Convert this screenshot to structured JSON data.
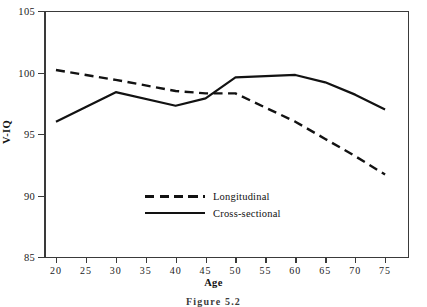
{
  "chart_data": {
    "type": "line",
    "title": "",
    "xlabel": "Age",
    "ylabel": "V-IQ",
    "xlim": [
      18,
      79
    ],
    "ylim": [
      85,
      105
    ],
    "xticks": [
      20,
      25,
      30,
      35,
      40,
      45,
      50,
      55,
      60,
      65,
      70,
      75
    ],
    "yticks": [
      85,
      90,
      95,
      100,
      105
    ],
    "grid": false,
    "legend_position": "inside-center-lower",
    "series": [
      {
        "name": "Longitudinal",
        "style": "dashed",
        "color": "#121212",
        "x": [
          20,
          30,
          40,
          45,
          50,
          60,
          65,
          70,
          75
        ],
        "values": [
          100.2,
          99.4,
          98.5,
          98.3,
          98.3,
          96.0,
          94.6,
          93.2,
          91.7
        ]
      },
      {
        "name": "Cross-sectional",
        "style": "solid",
        "color": "#121212",
        "x": [
          20,
          30,
          40,
          45,
          50,
          55,
          60,
          65,
          70,
          75
        ],
        "values": [
          96.0,
          98.4,
          97.3,
          97.9,
          99.6,
          99.7,
          99.8,
          99.2,
          98.2,
          97.0
        ]
      }
    ]
  },
  "axes": {
    "y_title": "V-IQ",
    "x_title": "Age",
    "y_tick_labels": [
      "85",
      "90",
      "95",
      "100",
      "105"
    ],
    "x_tick_labels": [
      "20",
      "25",
      "30",
      "35",
      "40",
      "45",
      "50",
      "55",
      "60",
      "65",
      "70",
      "75"
    ]
  },
  "legend": {
    "items": [
      {
        "label": "Longitudinal",
        "style": "dashed"
      },
      {
        "label": "Cross-sectional",
        "style": "solid"
      }
    ]
  },
  "caption": {
    "text": "Figure 5.2"
  }
}
